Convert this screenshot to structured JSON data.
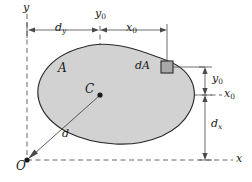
{
  "figure": {
    "colors": {
      "area_fill": "#d2d2d2",
      "area_stroke": "#2b2b2b",
      "line": "#4a4a4a",
      "dash": "#555555",
      "text": "#1a1a1a",
      "element_fill": "#a8a8a8",
      "background": "#ffffff"
    },
    "labels": {
      "y_axis": {
        "base": "y",
        "sub": ""
      },
      "x_axis": {
        "base": "x",
        "sub": ""
      },
      "x0_axis": {
        "base": "x",
        "sub": "0"
      },
      "y0_top": {
        "base": "y",
        "sub": "0"
      },
      "x0_top": {
        "base": "x",
        "sub": "0"
      },
      "y0_right": {
        "base": "y",
        "sub": "0"
      },
      "dy": {
        "base": "d",
        "sub": "y"
      },
      "dx": {
        "base": "d",
        "sub": "x"
      },
      "d": {
        "base": "d",
        "sub": ""
      },
      "origin": {
        "base": "O",
        "sub": ""
      },
      "centroid": {
        "base": "C",
        "sub": ""
      },
      "area": {
        "base": "A",
        "sub": ""
      },
      "element": {
        "base": "dA",
        "sub": ""
      }
    },
    "geometry": {
      "origin_point": {
        "x": 27,
        "y": 160
      },
      "centroid_point": {
        "x": 100,
        "y": 95
      },
      "element_point": {
        "x": 167,
        "y": 67
      },
      "y_axis_line_x": 27,
      "x_axis_line_y": 160,
      "x0_axis_line_y": 95,
      "y0_axis_line_x": 100,
      "element_extension_x": 167,
      "right_extension_x": 205
    }
  }
}
